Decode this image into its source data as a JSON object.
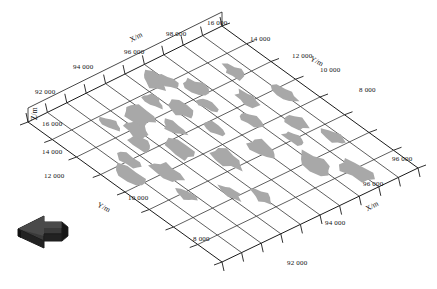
{
  "figure": {
    "kind": "3d-surface-scatter-plot",
    "background_color": "#ffffff",
    "blob_fill_color": "#a8a8a8",
    "grid_line_color": "#1a1a1a",
    "text_color": "#111111",
    "arrow_color": "#2e2e2e"
  },
  "axes": {
    "x_axis_title_top": "X/m",
    "x_axis_title_bottom": "X/m",
    "y_axis_title_top": "Y/m",
    "y_axis_title_bottom": "Y/m",
    "z_axis_title": "Z/m"
  },
  "ticks": {
    "x_top": [
      "92 000",
      "94 000",
      "96 000",
      "98 000"
    ],
    "y_top": [
      "16 000",
      "14 000",
      "12 000",
      "10 000",
      "8 000"
    ],
    "z_left": [
      "16 000",
      "14 000",
      "12 000",
      "10 000",
      "8 000"
    ],
    "y_left": [
      "16 000",
      "14 000",
      "12 000",
      "10 000",
      "8 000"
    ],
    "x_bottom": [
      "96 000",
      "96 000",
      "94 000",
      "92 000"
    ],
    "corner_top": "16 000",
    "corner_bottom": "92 000"
  },
  "tick_labels": [
    {
      "id": "t-x-92000",
      "text": "92 000",
      "x": 35,
      "y": 88
    },
    {
      "id": "t-x-94000",
      "text": "94 000",
      "x": 73,
      "y": 63
    },
    {
      "id": "t-x-96000",
      "text": "96 000",
      "x": 124,
      "y": 48
    },
    {
      "id": "t-x-98000",
      "text": "98 000",
      "x": 166,
      "y": 30
    },
    {
      "id": "t-y-16000",
      "text": "16 000",
      "x": 207,
      "y": 19
    },
    {
      "id": "t-y-14000",
      "text": "14 000",
      "x": 250,
      "y": 35
    },
    {
      "id": "t-y-12000",
      "text": "12 000",
      "x": 292,
      "y": 52
    },
    {
      "id": "t-y-10000",
      "text": "10 000",
      "x": 320,
      "y": 66
    },
    {
      "id": "t-y-8000",
      "text": "8 000",
      "x": 359,
      "y": 86
    },
    {
      "id": "t-z-16000",
      "text": "16 000",
      "x": 42,
      "y": 120
    },
    {
      "id": "t-z-14000",
      "text": "14 000",
      "x": 42,
      "y": 148
    },
    {
      "id": "t-z-12000",
      "text": "12 000",
      "x": 44,
      "y": 172
    },
    {
      "id": "t-yb-10000",
      "text": "10 000",
      "x": 128,
      "y": 194
    },
    {
      "id": "t-yb-8000",
      "text": "8 000",
      "x": 193,
      "y": 235
    },
    {
      "id": "t-xb-92000",
      "text": "92 000",
      "x": 287,
      "y": 259
    },
    {
      "id": "t-xb-94000",
      "text": "94 000",
      "x": 325,
      "y": 219
    },
    {
      "id": "t-xb-96000",
      "text": "96 000",
      "x": 363,
      "y": 180
    },
    {
      "id": "t-xb-98000",
      "text": "96 000",
      "x": 392,
      "y": 155
    }
  ],
  "axis_titles": [
    {
      "id": "title-x-top",
      "text": "X/m",
      "x": 128,
      "y": 36,
      "rot": -27
    },
    {
      "id": "title-y-top",
      "text": "Y/m",
      "x": 313,
      "y": 54,
      "rot": 27
    },
    {
      "id": "title-z-left",
      "text": "Z/m",
      "x": 30,
      "y": 120,
      "rot": -90
    },
    {
      "id": "title-y-bottom",
      "text": "Y/m",
      "x": 100,
      "y": 200,
      "rot": 27
    },
    {
      "id": "title-x-bottom",
      "text": "X/m",
      "x": 364,
      "y": 205,
      "rot": -27
    }
  ],
  "chart_data": {
    "type": "scatter",
    "title": "",
    "xlabel": "X/m",
    "ylabel": "Y/m",
    "zlabel": "Z/m",
    "xlim": [
      91000,
      99000
    ],
    "ylim": [
      7000,
      17000
    ],
    "zlim": [
      7000,
      17000
    ],
    "grid": true,
    "legend": false,
    "note": "3D perspective mesh surface grid with irregular gray patch regions distributed over the plane",
    "grid_cells_x": 10,
    "grid_cells_y": 8,
    "patches": [
      {
        "cx": 0.085,
        "cy": 0.44,
        "rx": 0.035,
        "ry": 0.075,
        "seed": 1
      },
      {
        "cx": 0.145,
        "cy": 0.37,
        "rx": 0.03,
        "ry": 0.06,
        "seed": 2
      },
      {
        "cx": 0.215,
        "cy": 0.5,
        "rx": 0.04,
        "ry": 0.07,
        "seed": 3
      },
      {
        "cx": 0.25,
        "cy": 0.33,
        "rx": 0.032,
        "ry": 0.055,
        "seed": 4
      },
      {
        "cx": 0.3,
        "cy": 0.26,
        "rx": 0.038,
        "ry": 0.06,
        "seed": 5
      },
      {
        "cx": 0.345,
        "cy": 0.43,
        "rx": 0.04,
        "ry": 0.07,
        "seed": 6
      },
      {
        "cx": 0.37,
        "cy": 0.2,
        "rx": 0.045,
        "ry": 0.07,
        "seed": 7
      },
      {
        "cx": 0.42,
        "cy": 0.33,
        "rx": 0.03,
        "ry": 0.055,
        "seed": 8
      },
      {
        "cx": 0.455,
        "cy": 0.57,
        "rx": 0.042,
        "ry": 0.072,
        "seed": 9
      },
      {
        "cx": 0.47,
        "cy": 0.17,
        "rx": 0.028,
        "ry": 0.05,
        "seed": 10
      },
      {
        "cx": 0.52,
        "cy": 0.26,
        "rx": 0.035,
        "ry": 0.058,
        "seed": 11
      },
      {
        "cx": 0.54,
        "cy": 0.41,
        "rx": 0.028,
        "ry": 0.05,
        "seed": 12
      },
      {
        "cx": 0.56,
        "cy": 0.09,
        "rx": 0.04,
        "ry": 0.062,
        "seed": 13
      },
      {
        "cx": 0.605,
        "cy": 0.6,
        "rx": 0.038,
        "ry": 0.065,
        "seed": 14
      },
      {
        "cx": 0.625,
        "cy": 0.3,
        "rx": 0.03,
        "ry": 0.052,
        "seed": 15
      },
      {
        "cx": 0.66,
        "cy": 0.2,
        "rx": 0.036,
        "ry": 0.058,
        "seed": 16
      },
      {
        "cx": 0.69,
        "cy": 0.45,
        "rx": 0.032,
        "ry": 0.056,
        "seed": 17
      },
      {
        "cx": 0.7,
        "cy": 0.77,
        "rx": 0.048,
        "ry": 0.085,
        "seed": 18
      },
      {
        "cx": 0.745,
        "cy": 0.62,
        "rx": 0.03,
        "ry": 0.05,
        "seed": 19
      },
      {
        "cx": 0.77,
        "cy": 0.36,
        "rx": 0.034,
        "ry": 0.058,
        "seed": 20
      },
      {
        "cx": 0.8,
        "cy": 0.88,
        "rx": 0.045,
        "ry": 0.08,
        "seed": 21
      },
      {
        "cx": 0.82,
        "cy": 0.55,
        "rx": 0.032,
        "ry": 0.055,
        "seed": 22
      },
      {
        "cx": 0.845,
        "cy": 0.22,
        "rx": 0.03,
        "ry": 0.052,
        "seed": 23
      },
      {
        "cx": 0.875,
        "cy": 0.7,
        "rx": 0.03,
        "ry": 0.055,
        "seed": 24
      },
      {
        "cx": 0.905,
        "cy": 0.42,
        "rx": 0.034,
        "ry": 0.06,
        "seed": 25
      },
      {
        "cx": 0.175,
        "cy": 0.64,
        "rx": 0.026,
        "ry": 0.045,
        "seed": 26
      },
      {
        "cx": 0.32,
        "cy": 0.72,
        "rx": 0.03,
        "ry": 0.052,
        "seed": 27
      },
      {
        "cx": 0.4,
        "cy": 0.8,
        "rx": 0.028,
        "ry": 0.048,
        "seed": 28
      },
      {
        "cx": 0.245,
        "cy": 0.18,
        "rx": 0.026,
        "ry": 0.045,
        "seed": 29
      },
      {
        "cx": 0.6,
        "cy": 0.12,
        "rx": 0.026,
        "ry": 0.044,
        "seed": 30
      }
    ]
  },
  "north_arrow": {
    "name": "north-arrow-indicator",
    "label": ""
  }
}
